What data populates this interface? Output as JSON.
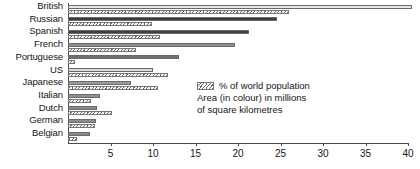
{
  "chart_data": {
    "type": "bar",
    "orientation": "horizontal",
    "title": "",
    "xlabel": "",
    "ylabel": "",
    "xlim": [
      0,
      40
    ],
    "xticks": [
      5,
      10,
      15,
      20,
      25,
      30,
      35,
      40
    ],
    "xtick_labels": [
      "5",
      "10",
      "15",
      "20",
      "25",
      "30",
      "35",
      "40"
    ],
    "grid": false,
    "legend_position": "inside-right",
    "categories": [
      "British",
      "Russian",
      "Spanish",
      "French",
      "Portuguese",
      "US",
      "Japanese",
      "Italian",
      "Dutch",
      "German",
      "Belgian"
    ],
    "series": [
      {
        "name": "% of world population",
        "style": "hatched",
        "values": [
          26.0,
          9.9,
          10.8,
          8.0,
          0.8,
          11.8,
          10.6,
          2.7,
          5.2,
          3.2,
          1.0
        ]
      },
      {
        "name": "Area (in colour) in millions of square kilometres",
        "style": "solid-grey",
        "values": [
          40.5,
          24.6,
          21.3,
          19.6,
          13.0,
          10.0,
          7.4,
          3.8,
          3.4,
          3.3,
          2.6
        ],
        "bar_colors": [
          "#e8e8e8",
          "#3b3b3b",
          "#3f3f3f",
          "#8e8e8e",
          "#6f6f6f",
          "#d9d9d9",
          "#9a9a9a",
          "#919191",
          "#8a8a8a",
          "#8e8e8e",
          "#8b8b8b"
        ]
      }
    ],
    "legend": [
      {
        "label": "% of world population",
        "swatch": "hatched"
      },
      {
        "label": "Area (in colour) in millions",
        "swatch": "none"
      },
      {
        "label": "of square kilometres",
        "swatch": "none"
      }
    ]
  },
  "colors": {
    "axis": "#4a4a4a",
    "text": "#151515",
    "hatch": "#6d6d6d"
  }
}
